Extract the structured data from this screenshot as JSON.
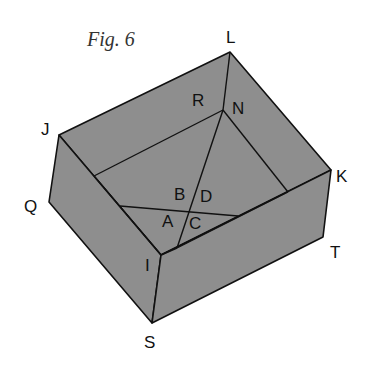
{
  "figure": {
    "title": "Fig. 6",
    "fill_color": "#8e8e8e",
    "line_color": "#111111"
  },
  "vertices": {
    "L": "L",
    "J": "J",
    "K": "K",
    "Q": "Q",
    "I": "I",
    "T": "T",
    "S": "S",
    "R": "R",
    "N": "N"
  },
  "angle_labels": {
    "A": "A",
    "B": "B",
    "C": "C",
    "D": "D"
  }
}
